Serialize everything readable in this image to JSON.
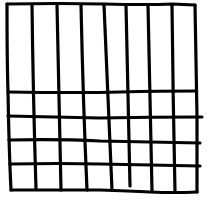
{
  "diagram": {
    "type": "hand-drawn grid",
    "columns": 8,
    "rows": {
      "tall_upper_rows": 1,
      "short_lower_rows": 4
    },
    "line_color": "#000000",
    "background_color": "#ffffff"
  }
}
